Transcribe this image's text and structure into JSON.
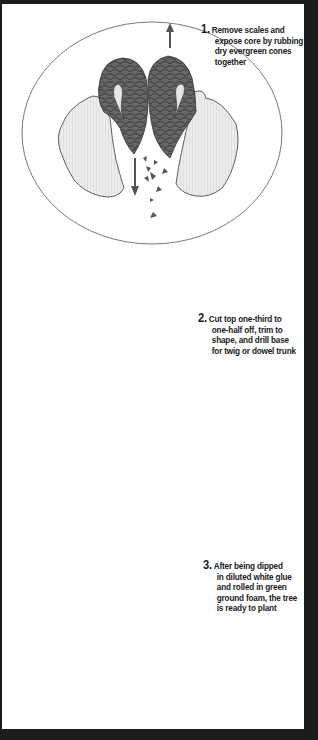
{
  "panel": {
    "background": "#ffffff",
    "frame": "#1c1c1c"
  },
  "steps": [
    {
      "number": "1.",
      "lines": [
        "Remove scales and",
        "expose core by rubbing",
        "dry evergreen cones",
        "together"
      ],
      "illustration": "hands-rubbing-pine-cones-icon"
    },
    {
      "number": "2.",
      "lines": [
        "Cut top one-third to",
        "one-half off, trim to",
        "shape, and drill base",
        "for twig or dowel trunk"
      ],
      "illustration": "scissors-trimming-cone-icon"
    },
    {
      "number": "3.",
      "lines": [
        "After being dipped",
        "in diluted white glue",
        "and rolled in green",
        "ground foam, the tree",
        "is ready to plant"
      ],
      "illustration": "glue-glass-foam-tray-tree-icon"
    }
  ],
  "colors": {
    "cone": "#5e5e5e",
    "hand": "#e6e6e6",
    "outline": "#3a3a3a",
    "ellipse": "#6a6a6a",
    "glue": "#bdbdbd"
  }
}
